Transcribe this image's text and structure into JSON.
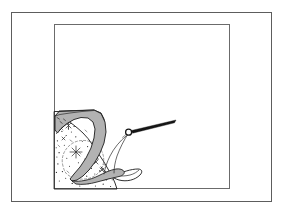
{
  "figure": {
    "caption_text": "",
    "background_color": "#ffffff",
    "width": 283,
    "height": 211
  },
  "frames": {
    "outer": {
      "name": "outer-border",
      "x": 11,
      "y": 12,
      "width": 261,
      "height": 190,
      "stroke_color": "#5d5d5d"
    },
    "inner": {
      "name": "inner-plate-border",
      "x": 54,
      "y": 24,
      "width": 176,
      "height": 165,
      "stroke_color": "#6b6b6b"
    }
  },
  "illustration": {
    "type": "line-drawing-cross-section",
    "elements": [
      {
        "name": "gray-wedge-body",
        "fill_color": "#b2b2b2",
        "stroke_color": "#1b1b1b",
        "description": "curved tapering wedge descending from upper left to a hooked toe at lower right"
      },
      {
        "name": "stippled-substrate",
        "fill_color": "#ffffff",
        "stroke_color": "#1b1b1b",
        "description": "speckled block with star marks and dashed oval boundary at lower left"
      },
      {
        "name": "needle-pointer",
        "fill_color": "#151515",
        "stroke_color": "#151515",
        "description": "tapered needle with small ring pivot aimed to the upper right"
      },
      {
        "name": "hook-toe-outline",
        "stroke_color": "#1b1b1b",
        "description": "thin outline of the curled toe beneath the wedge"
      }
    ],
    "gray_fill": "#b2b2b2",
    "ink_color": "#1b1b1b"
  }
}
